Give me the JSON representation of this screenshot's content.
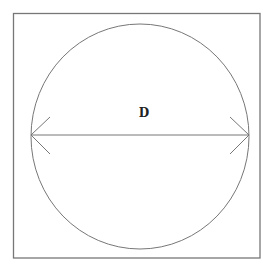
{
  "diagram": {
    "label": "D",
    "colors": {
      "stroke": "#777777",
      "text": "#222222",
      "background": "#ffffff"
    },
    "shapes": {
      "square": {
        "x": 13.5,
        "y": 13.5,
        "width": 246.5,
        "height": 244.5
      },
      "circle": {
        "cx": 140,
        "cy": 136.5,
        "rx": 109,
        "ry": 112.5
      },
      "diameter": {
        "x1": 31,
        "y1": 135,
        "x2": 249,
        "y2": 135
      },
      "arrow_left": {
        "tip": [
          31,
          135
        ],
        "arm_top": [
          50,
          117
        ],
        "arm_bottom": [
          50,
          154
        ]
      },
      "arrow_right": {
        "tip": [
          249,
          135
        ],
        "arm_top": [
          230,
          117
        ],
        "arm_bottom": [
          230,
          154
        ]
      },
      "label_position": {
        "x": 144,
        "y": 117
      }
    }
  }
}
